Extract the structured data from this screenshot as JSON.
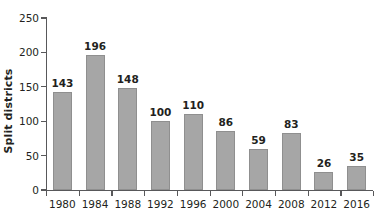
{
  "chart_data": {
    "type": "bar",
    "title": "",
    "xlabel": "",
    "ylabel": "Split districts",
    "categories": [
      "1980",
      "1984",
      "1988",
      "1992",
      "1996",
      "2000",
      "2004",
      "2008",
      "2012",
      "2016"
    ],
    "values": [
      143,
      196,
      148,
      100,
      110,
      86,
      59,
      83,
      26,
      35
    ],
    "value_labels": [
      "143",
      "196",
      "148",
      "100",
      "110",
      "86",
      "59",
      "83",
      "26",
      "35"
    ],
    "ylim": [
      0,
      250
    ],
    "yticks": [
      0,
      50,
      100,
      150,
      200,
      250
    ],
    "ytick_labels": [
      "0",
      "50",
      "100",
      "150",
      "200",
      "250"
    ],
    "grid": false,
    "legend": null,
    "bar_color": "#a6a6a6",
    "bar_edge_color": "#8f8f8f",
    "axis_color": "#58585a",
    "text_color": "#231f20"
  }
}
